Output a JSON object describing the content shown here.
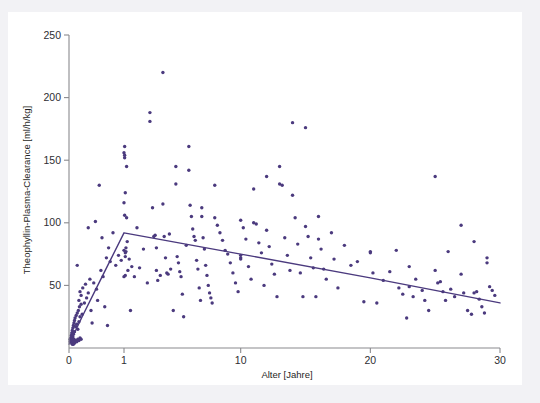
{
  "figure": {
    "background_color": "#f2f2f5",
    "panel_color": "#ffffff",
    "caption": ""
  },
  "chart_data": {
    "type": "scatter",
    "title": "",
    "subtitle": "",
    "xlabel": "Alter [Jahre]",
    "ylabel": "Theophyllin-Plasma-Clearance [ml/h/kg]",
    "xtick_labels": [
      "0",
      "1",
      "10",
      "20",
      "30"
    ],
    "xtick_values": [
      0,
      1,
      10,
      20,
      30
    ],
    "ytick_labels": [
      "50",
      "100",
      "150",
      "200",
      "250"
    ],
    "ytick_values": [
      50,
      100,
      150,
      200,
      250
    ],
    "xlim": [
      0,
      30
    ],
    "ylim": [
      0,
      250
    ],
    "x_scale": "piecewise (0-1 expanded, 1-30 linear)",
    "grid": false,
    "legend": null,
    "point_color": "#4b3a7e",
    "curve_color": "#4b3a7e",
    "series": [
      {
        "name": "Theophyllin-Plasma-Clearance vs. Alter",
        "marker": "dot",
        "points": [
          [
            0.02,
            5
          ],
          [
            0.02,
            7
          ],
          [
            0.03,
            8
          ],
          [
            0.03,
            6
          ],
          [
            0.04,
            10
          ],
          [
            0.04,
            5
          ],
          [
            0.05,
            12
          ],
          [
            0.05,
            8
          ],
          [
            0.06,
            14
          ],
          [
            0.06,
            6
          ],
          [
            0.07,
            16
          ],
          [
            0.07,
            9
          ],
          [
            0.08,
            18
          ],
          [
            0.08,
            11
          ],
          [
            0.09,
            20
          ],
          [
            0.09,
            7
          ],
          [
            0.1,
            22
          ],
          [
            0.1,
            13
          ],
          [
            0.11,
            24
          ],
          [
            0.12,
            17
          ],
          [
            0.13,
            26
          ],
          [
            0.14,
            19
          ],
          [
            0.15,
            28
          ],
          [
            0.16,
            15
          ],
          [
            0.17,
            30
          ],
          [
            0.18,
            21
          ],
          [
            0.19,
            33
          ],
          [
            0.2,
            25
          ],
          [
            0.22,
            35
          ],
          [
            0.24,
            27
          ],
          [
            0.05,
            4
          ],
          [
            0.06,
            3
          ],
          [
            0.07,
            4
          ],
          [
            0.08,
            3
          ],
          [
            0.09,
            5
          ],
          [
            0.1,
            4
          ],
          [
            0.12,
            6
          ],
          [
            0.14,
            5
          ],
          [
            0.16,
            7
          ],
          [
            0.18,
            6
          ],
          [
            0.2,
            8
          ],
          [
            0.22,
            7
          ],
          [
            0.15,
            66
          ],
          [
            0.18,
            38
          ],
          [
            0.2,
            45
          ],
          [
            0.22,
            42
          ],
          [
            0.25,
            48
          ],
          [
            0.28,
            36
          ],
          [
            0.3,
            51
          ],
          [
            0.32,
            40
          ],
          [
            0.35,
            96
          ],
          [
            0.35,
            44
          ],
          [
            0.38,
            55
          ],
          [
            0.4,
            30
          ],
          [
            0.42,
            20
          ],
          [
            0.45,
            52
          ],
          [
            0.48,
            101
          ],
          [
            0.5,
            47
          ],
          [
            0.52,
            38
          ],
          [
            0.55,
            130
          ],
          [
            0.58,
            62
          ],
          [
            0.6,
            88
          ],
          [
            0.62,
            57
          ],
          [
            0.65,
            33
          ],
          [
            0.68,
            72
          ],
          [
            0.7,
            18
          ],
          [
            0.72,
            80
          ],
          [
            0.75,
            69
          ],
          [
            0.8,
            92
          ],
          [
            0.85,
            66
          ],
          [
            0.9,
            74
          ],
          [
            0.95,
            70
          ],
          [
            1.0,
            156
          ],
          [
            1.0,
            116
          ],
          [
            1.0,
            78
          ],
          [
            1.0,
            57
          ],
          [
            1.05,
            161
          ],
          [
            1.05,
            152
          ],
          [
            1.05,
            154
          ],
          [
            1.05,
            106
          ],
          [
            1.1,
            124
          ],
          [
            1.1,
            76
          ],
          [
            1.1,
            73
          ],
          [
            1.1,
            58
          ],
          [
            1.15,
            80
          ],
          [
            1.15,
            77
          ],
          [
            1.2,
            145
          ],
          [
            1.2,
            104
          ],
          [
            1.25,
            85
          ],
          [
            1.3,
            62
          ],
          [
            1.4,
            71
          ],
          [
            1.5,
            30
          ],
          [
            1.6,
            65
          ],
          [
            1.8,
            57
          ],
          [
            2.0,
            96
          ],
          [
            2.2,
            64
          ],
          [
            2.5,
            79
          ],
          [
            2.8,
            52
          ],
          [
            3.0,
            181
          ],
          [
            3.0,
            188
          ],
          [
            3.2,
            112
          ],
          [
            3.3,
            89
          ],
          [
            3.4,
            90
          ],
          [
            3.5,
            80
          ],
          [
            3.5,
            62
          ],
          [
            3.6,
            54
          ],
          [
            3.8,
            58
          ],
          [
            4.0,
            220
          ],
          [
            4.0,
            115
          ],
          [
            4.1,
            89
          ],
          [
            4.2,
            72
          ],
          [
            4.3,
            60
          ],
          [
            4.4,
            59
          ],
          [
            4.5,
            91
          ],
          [
            4.6,
            63
          ],
          [
            4.8,
            30
          ],
          [
            5.0,
            145
          ],
          [
            5.0,
            131
          ],
          [
            5.1,
            73
          ],
          [
            5.2,
            68
          ],
          [
            5.3,
            61
          ],
          [
            5.4,
            57
          ],
          [
            5.5,
            43
          ],
          [
            5.6,
            25
          ],
          [
            5.8,
            82
          ],
          [
            6.0,
            161
          ],
          [
            6.0,
            142
          ],
          [
            6.1,
            114
          ],
          [
            6.2,
            105
          ],
          [
            6.3,
            95
          ],
          [
            6.4,
            89
          ],
          [
            6.5,
            86
          ],
          [
            6.6,
            70
          ],
          [
            6.7,
            63
          ],
          [
            6.8,
            48
          ],
          [
            6.9,
            38
          ],
          [
            7.0,
            112
          ],
          [
            7.0,
            105
          ],
          [
            7.1,
            88
          ],
          [
            7.2,
            79
          ],
          [
            7.3,
            66
          ],
          [
            7.4,
            58
          ],
          [
            7.5,
            50
          ],
          [
            7.6,
            44
          ],
          [
            7.7,
            40
          ],
          [
            7.8,
            36
          ],
          [
            8.0,
            130
          ],
          [
            8.0,
            104
          ],
          [
            8.2,
            98
          ],
          [
            8.4,
            92
          ],
          [
            8.6,
            86
          ],
          [
            8.8,
            78
          ],
          [
            9.0,
            75
          ],
          [
            9.2,
            68
          ],
          [
            9.4,
            60
          ],
          [
            9.6,
            52
          ],
          [
            9.8,
            45
          ],
          [
            10.0,
            102
          ],
          [
            10.0,
            74
          ],
          [
            10.0,
            72
          ],
          [
            10.0,
            71
          ],
          [
            10.2,
            96
          ],
          [
            10.4,
            87
          ],
          [
            10.6,
            65
          ],
          [
            10.8,
            55
          ],
          [
            11.0,
            127
          ],
          [
            11.0,
            100
          ],
          [
            11.2,
            99
          ],
          [
            11.4,
            84
          ],
          [
            11.6,
            76
          ],
          [
            11.8,
            50
          ],
          [
            12.0,
            137
          ],
          [
            12.0,
            94
          ],
          [
            12.2,
            81
          ],
          [
            12.4,
            67
          ],
          [
            12.6,
            59
          ],
          [
            12.8,
            41
          ],
          [
            13.0,
            145
          ],
          [
            13.0,
            131
          ],
          [
            13.2,
            130
          ],
          [
            13.4,
            88
          ],
          [
            13.6,
            74
          ],
          [
            13.8,
            62
          ],
          [
            14.0,
            180
          ],
          [
            14.0,
            122
          ],
          [
            14.2,
            104
          ],
          [
            14.4,
            83
          ],
          [
            14.6,
            60
          ],
          [
            14.8,
            41
          ],
          [
            15.0,
            176
          ],
          [
            15.0,
            97
          ],
          [
            15.2,
            89
          ],
          [
            15.4,
            72
          ],
          [
            15.6,
            64
          ],
          [
            15.8,
            41
          ],
          [
            16.0,
            105
          ],
          [
            16.0,
            87
          ],
          [
            16.2,
            79
          ],
          [
            16.4,
            63
          ],
          [
            16.6,
            55
          ],
          [
            17.0,
            92
          ],
          [
            17.2,
            71
          ],
          [
            17.5,
            48
          ],
          [
            18.0,
            82
          ],
          [
            18.5,
            66
          ],
          [
            19.0,
            69
          ],
          [
            19.5,
            37
          ],
          [
            20.0,
            77
          ],
          [
            20.0,
            76
          ],
          [
            20.2,
            60
          ],
          [
            20.5,
            36
          ],
          [
            21.0,
            54
          ],
          [
            21.5,
            61
          ],
          [
            22.0,
            78
          ],
          [
            22.2,
            48
          ],
          [
            22.5,
            43
          ],
          [
            22.8,
            24
          ],
          [
            23.0,
            65
          ],
          [
            23.0,
            49
          ],
          [
            23.3,
            41
          ],
          [
            23.5,
            55
          ],
          [
            24.0,
            46
          ],
          [
            24.2,
            38
          ],
          [
            24.5,
            30
          ],
          [
            25.0,
            137
          ],
          [
            25.0,
            62
          ],
          [
            25.2,
            52
          ],
          [
            25.4,
            53
          ],
          [
            25.6,
            45
          ],
          [
            25.8,
            38
          ],
          [
            26.0,
            77
          ],
          [
            26.2,
            47
          ],
          [
            26.5,
            41
          ],
          [
            27.0,
            98
          ],
          [
            27.0,
            59
          ],
          [
            27.2,
            44
          ],
          [
            27.5,
            30
          ],
          [
            27.8,
            27
          ],
          [
            28.0,
            85
          ],
          [
            28.0,
            44
          ],
          [
            28.2,
            45
          ],
          [
            28.4,
            39
          ],
          [
            28.6,
            33
          ],
          [
            28.8,
            28
          ],
          [
            29.0,
            72
          ],
          [
            29.0,
            68
          ],
          [
            29.2,
            49
          ],
          [
            29.4,
            46
          ],
          [
            29.6,
            42
          ]
        ]
      }
    ],
    "fit_curve": {
      "name": "regression fit",
      "description": "steep rise from near 0 at age 0 to peak ~92 ml/h/kg at age ~1, then linear decline to ~36 ml/h/kg at age 30",
      "points": [
        [
          0.0,
          3
        ],
        [
          0.25,
          26
        ],
        [
          0.5,
          48
        ],
        [
          0.75,
          70
        ],
        [
          1.0,
          92
        ],
        [
          10,
          75
        ],
        [
          20,
          56
        ],
        [
          30,
          36
        ]
      ]
    }
  }
}
